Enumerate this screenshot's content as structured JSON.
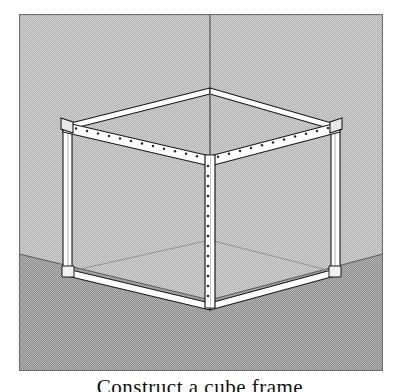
{
  "figure": {
    "caption": "Construct a cube frame",
    "panel": {
      "x": 19,
      "y": 14,
      "width": 364,
      "height": 357,
      "border_color": "#6f6f6f"
    }
  },
  "colors": {
    "wall": "#d2d2d2",
    "wall_dither": "#b2b2b2",
    "floor": "#b4b4b4",
    "floor_dither": "#8e8e8e",
    "outline": "#1a1a1a",
    "beam_fill": "#ffffff",
    "beam_shade": "#e2e2e2",
    "hole": "#2b2b2b",
    "panel_border": "#6f6f6f"
  },
  "room": {
    "wall_corner_line_x": 210,
    "floor_horizon_left_y": 254,
    "floor_corner": {
      "x": 210,
      "y": 300
    },
    "floor_horizon_right_y": 254
  },
  "structure": {
    "name": "slotted-angle cube frame",
    "vertices": {
      "top_front": {
        "x": 210,
        "y": 156
      },
      "top_left": {
        "x": 67,
        "y": 124
      },
      "top_right": {
        "x": 335,
        "y": 124
      },
      "top_back": {
        "x": 210,
        "y": 88
      },
      "bottom_front": {
        "x": 210,
        "y": 307
      },
      "bottom_left": {
        "x": 70,
        "y": 272
      },
      "bottom_right": {
        "x": 333,
        "y": 272
      },
      "bottom_back": {
        "x": 210,
        "y": 240
      }
    },
    "beam_thickness_px": 7,
    "perforated_members": [
      "top-front-left-beam",
      "top-front-right-beam",
      "front-center-post"
    ],
    "plain_members": [
      "top-back-left-beam",
      "top-back-right-beam",
      "left-post",
      "right-post",
      "bottom-front-left-beam",
      "bottom-front-right-beam"
    ],
    "holes": {
      "top_left_beam_count": 13,
      "top_right_beam_count": 13,
      "center_post_count": 16
    }
  }
}
